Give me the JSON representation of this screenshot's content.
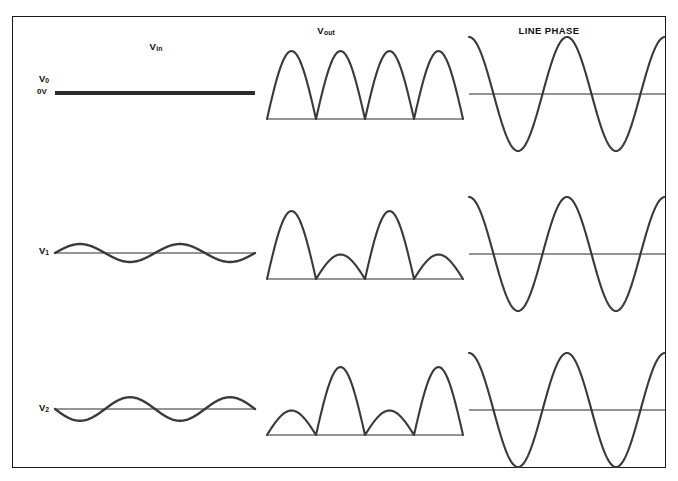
{
  "figure": {
    "background_color": "#ffffff",
    "border_color": "#1a1a1a",
    "trace_color": "#3a3a3a",
    "baseline_color": "#2b2b2b",
    "columns": [
      {
        "id": "vin",
        "label": "V",
        "sublabel": "in"
      },
      {
        "id": "vout",
        "label": "V",
        "sublabel": "out"
      },
      {
        "id": "line_phase",
        "label": "LINE PHASE",
        "sublabel": ""
      }
    ],
    "rows": [
      {
        "id": "v0",
        "label": "V",
        "sublabel": "0",
        "zero_label": "0V"
      },
      {
        "id": "v1",
        "label": "V",
        "sublabel": "1",
        "zero_label": ""
      },
      {
        "id": "v2",
        "label": "V",
        "sublabel": "2",
        "zero_label": ""
      }
    ]
  },
  "chart_data": {
    "type": "line",
    "title": "",
    "xlabel": "",
    "ylabel": "",
    "grid": false,
    "legend": "none",
    "panels": [
      {
        "row": "v0",
        "column": "vin",
        "waveform": "flat-dc",
        "cycles": 0,
        "amplitude": 0,
        "phase_deg": 0,
        "baseline_level": "0V",
        "note": "Zero volts, flat heavy horizontal line at the 0V baseline"
      },
      {
        "row": "v0",
        "column": "vout",
        "waveform": "rectified-humps",
        "cycles": 4,
        "hump_heights": [
          1.0,
          1.0,
          1.0,
          1.0
        ],
        "note": "Four equal full-conduction half-sine humps above baseline"
      },
      {
        "row": "v0",
        "column": "line_phase",
        "waveform": "cosine",
        "cycles": 2,
        "amplitude": 1.0,
        "phase_deg": 90,
        "note": "Large amplitude AC line reference, starts near positive peak"
      },
      {
        "row": "v1",
        "column": "vin",
        "waveform": "sine",
        "cycles": 2,
        "amplitude": 0.32,
        "phase_deg": 0,
        "note": "Small amplitude sine starting positive-going"
      },
      {
        "row": "v1",
        "column": "vout",
        "waveform": "rectified-humps",
        "cycles": 4,
        "hump_heights": [
          1.0,
          0.36,
          1.0,
          0.36
        ],
        "note": "Alternating tall and short humps; tall hump first"
      },
      {
        "row": "v1",
        "column": "line_phase",
        "waveform": "cosine",
        "cycles": 2,
        "amplitude": 1.0,
        "phase_deg": 90,
        "note": "Identical line phase reference"
      },
      {
        "row": "v2",
        "column": "vin",
        "waveform": "sine",
        "cycles": 2,
        "amplitude": 0.42,
        "phase_deg": 180,
        "note": "Larger amplitude sine starting negative-going, inverted phase"
      },
      {
        "row": "v2",
        "column": "vout",
        "waveform": "rectified-humps",
        "cycles": 4,
        "hump_heights": [
          0.36,
          1.0,
          0.36,
          1.0
        ],
        "note": "Alternating short and tall humps; short hump first"
      },
      {
        "row": "v2",
        "column": "line_phase",
        "waveform": "cosine",
        "cycles": 2,
        "amplitude": 1.0,
        "phase_deg": 90,
        "note": "Identical line phase reference"
      }
    ]
  }
}
